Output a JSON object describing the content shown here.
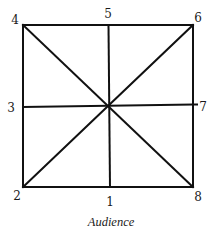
{
  "diagram": {
    "caption": "Audience",
    "stroke_color": "#111111",
    "positions": [
      {
        "id": "1",
        "label": "1",
        "location": "bottom-center"
      },
      {
        "id": "2",
        "label": "2",
        "location": "bottom-left"
      },
      {
        "id": "3",
        "label": "3",
        "location": "middle-left"
      },
      {
        "id": "4",
        "label": "4",
        "location": "top-left"
      },
      {
        "id": "5",
        "label": "5",
        "location": "top-center"
      },
      {
        "id": "6",
        "label": "6",
        "location": "top-right"
      },
      {
        "id": "7",
        "label": "7",
        "location": "middle-right"
      },
      {
        "id": "8",
        "label": "8",
        "location": "bottom-right"
      }
    ],
    "shape": "square divided by two diagonals, a vertical and a horizontal line through the center"
  }
}
